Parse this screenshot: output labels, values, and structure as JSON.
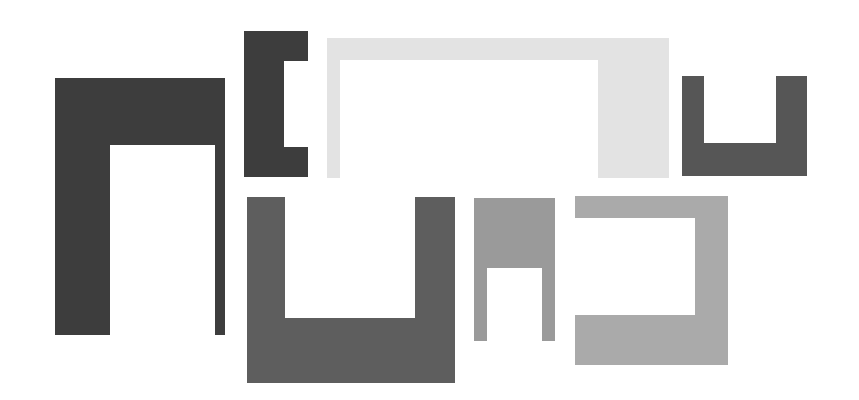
{
  "canvas": {
    "width": 859,
    "height": 400,
    "background_color": "#ffffff",
    "title": "Abstract Geometric Bracket Composition"
  },
  "palette": {
    "near_black": "#3d3d3d",
    "dark_gray": "#565656",
    "mid_gray": "#5e5e5e",
    "gray": "#9a9a9a",
    "light_mid_gray": "#aaaaaa",
    "very_light_gray": "#e3e3e3",
    "white": "#ffffff"
  },
  "shapes": [
    {
      "id": "shape-1",
      "name": "inverted-u-bracket-dark-large",
      "label": "Inverted U bracket, dark, large, thick left leg",
      "orientation": "opening-down",
      "color": "#3d3d3d",
      "x": 55,
      "y": 78,
      "width": 170,
      "height": 257,
      "notch": {
        "x": 55,
        "y": 67,
        "width": 105,
        "height": 190
      }
    },
    {
      "id": "shape-2",
      "name": "c-bracket-dark-small",
      "label": "C bracket, dark, opening right",
      "orientation": "opening-right",
      "color": "#3d3d3d",
      "x": 244,
      "y": 31,
      "width": 64,
      "height": 146,
      "notch": {
        "x": 40,
        "y": 30,
        "width": 24,
        "height": 86
      }
    },
    {
      "id": "shape-3",
      "name": "inverted-u-bracket-light-wide",
      "label": "Inverted U bracket, very light gray, wide, thick right leg",
      "orientation": "opening-down",
      "color": "#e3e3e3",
      "x": 327,
      "y": 38,
      "width": 342,
      "height": 140,
      "notch": {
        "x": 13,
        "y": 22,
        "width": 258,
        "height": 118
      }
    },
    {
      "id": "shape-4",
      "name": "u-bracket-dark-right",
      "label": "U bracket, dark gray, opening up",
      "orientation": "opening-up",
      "color": "#565656",
      "x": 682,
      "y": 76,
      "width": 125,
      "height": 100,
      "notch": {
        "x": 22,
        "y": 0,
        "width": 72,
        "height": 67
      }
    },
    {
      "id": "shape-5",
      "name": "u-bracket-mid-gray-large",
      "label": "U bracket, mid gray, large, opening up",
      "orientation": "opening-up",
      "color": "#5e5e5e",
      "x": 247,
      "y": 197,
      "width": 208,
      "height": 186,
      "notch": {
        "x": 38,
        "y": 0,
        "width": 130,
        "height": 121
      }
    },
    {
      "id": "shape-6",
      "name": "inverted-u-bracket-gray-small",
      "label": "Inverted U bracket, gray, small, opening down",
      "orientation": "opening-down",
      "color": "#9a9a9a",
      "x": 474,
      "y": 198,
      "width": 81,
      "height": 143,
      "notch": {
        "x": 13,
        "y": 70,
        "width": 55,
        "height": 73
      }
    },
    {
      "id": "shape-7",
      "name": "c-bracket-light-gray-reversed",
      "label": "Reversed C bracket, light gray, opening left",
      "orientation": "opening-left",
      "color": "#aaaaaa",
      "x": 575,
      "y": 196,
      "width": 153,
      "height": 169,
      "notch": {
        "x": 0,
        "y": 22,
        "width": 120,
        "height": 97
      }
    }
  ]
}
